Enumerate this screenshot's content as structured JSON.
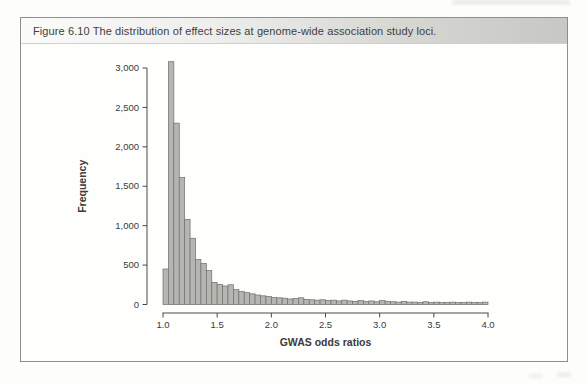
{
  "figure": {
    "caption": "Figure 6.10   The distribution of effect sizes at genome-wide association study loci."
  },
  "chart_data": {
    "type": "bar",
    "subtype": "histogram",
    "title": "",
    "xlabel": "GWAS odds ratios",
    "ylabel": "Frequency",
    "bin_start": 1.0,
    "bin_width": 0.05,
    "xlim": [
      1.0,
      4.0
    ],
    "ylim": [
      0,
      3000
    ],
    "grid": "off",
    "legend": "none",
    "x_ticks": [
      1.0,
      1.5,
      2.0,
      2.5,
      3.0,
      3.5,
      4.0
    ],
    "x_tick_labels": [
      "1.0",
      "1.5",
      "2.0",
      "2.5",
      "3.0",
      "3.5",
      "4.0"
    ],
    "y_ticks": [
      0,
      500,
      1000,
      1500,
      2000,
      2500,
      3000
    ],
    "y_tick_labels": [
      "0",
      "500",
      "1,000",
      "1,500",
      "2,000",
      "2,500",
      "3,000"
    ],
    "values": [
      450,
      3080,
      2300,
      1610,
      1080,
      840,
      570,
      520,
      430,
      280,
      255,
      235,
      250,
      190,
      165,
      150,
      135,
      120,
      110,
      100,
      90,
      85,
      80,
      70,
      75,
      85,
      65,
      60,
      55,
      60,
      50,
      55,
      45,
      55,
      45,
      40,
      50,
      40,
      45,
      35,
      50,
      40,
      35,
      30,
      40,
      30,
      30,
      25,
      35,
      25,
      30,
      25,
      25,
      30,
      25,
      25,
      30,
      25,
      25,
      30
    ],
    "bar_fill": "#b5b5b2",
    "bar_stroke": "#74746f",
    "axis_color": "#4a4a47",
    "label_color": "#3b3b39"
  }
}
